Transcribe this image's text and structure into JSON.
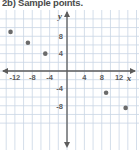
{
  "title": "2b) Sample points.",
  "chart_data": {
    "type": "scatter",
    "title": "2b) Sample points.",
    "xlabel": "x",
    "ylabel": "y",
    "xlim": [
      -16,
      16
    ],
    "ylim": [
      -12,
      12
    ],
    "xticks": [
      -12,
      -8,
      -4,
      4,
      8,
      12
    ],
    "xtick_labels": [
      "-12",
      "-8",
      "-4",
      "4",
      "8",
      "12"
    ],
    "yticks": [
      8,
      4,
      -4,
      -8
    ],
    "ytick_labels": [
      "8",
      "4",
      "-4",
      "-8"
    ],
    "grid": true,
    "grid_step": 2,
    "legend": "none",
    "points": [
      {
        "x": -13,
        "y": 9
      },
      {
        "x": -9,
        "y": 6.5
      },
      {
        "x": -5,
        "y": 4
      },
      {
        "x": 9,
        "y": -5
      },
      {
        "x": 13.5,
        "y": -8.5
      }
    ],
    "point_color": "#6b6b6b",
    "axis_color": "#5c5c5c",
    "grid_color": "#c9d6e4"
  },
  "colors": {
    "grid": "#c9d6e4",
    "axis": "#5c5c5c",
    "point": "#6b6b6b",
    "text": "#4a4a4a",
    "background": "#ffffff"
  }
}
